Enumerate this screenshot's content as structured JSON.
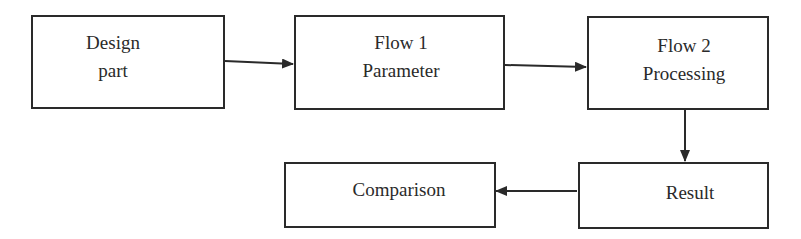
{
  "diagram": {
    "type": "flowchart",
    "line_color": "#2a2a2a",
    "background": "#ffffff",
    "nodes": [
      {
        "id": "design",
        "line1": "Design",
        "line2": "part"
      },
      {
        "id": "flow1",
        "line1": "Flow 1",
        "line2": "Parameter"
      },
      {
        "id": "flow2",
        "line1": "Flow 2",
        "line2": "Processing"
      },
      {
        "id": "result",
        "line1": "Result"
      },
      {
        "id": "comparison",
        "line1": "Comparison"
      }
    ],
    "edges": [
      {
        "from": "design",
        "to": "flow1"
      },
      {
        "from": "flow1",
        "to": "flow2"
      },
      {
        "from": "flow2",
        "to": "result"
      },
      {
        "from": "result",
        "to": "comparison"
      }
    ]
  }
}
